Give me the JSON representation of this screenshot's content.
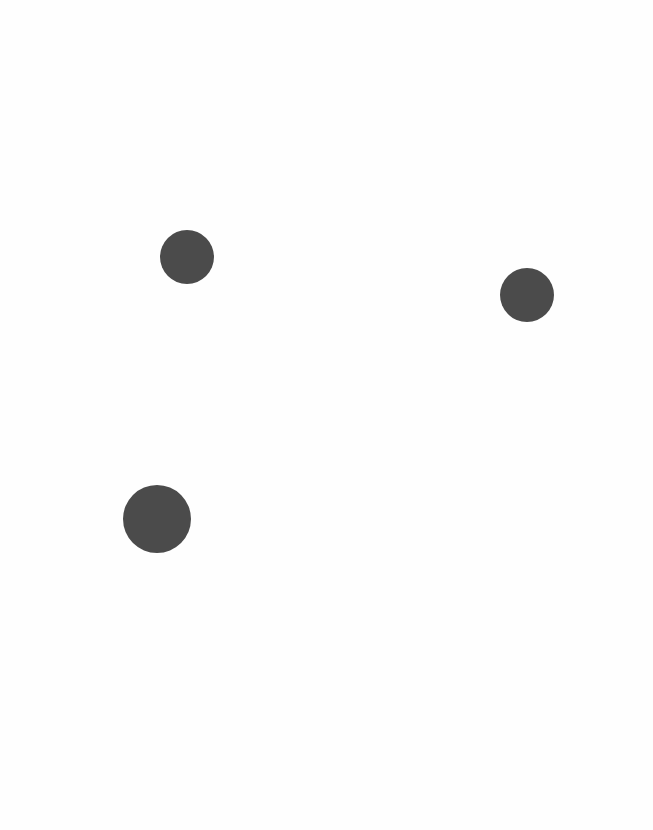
{
  "canvas": {
    "background": "#fefefe",
    "width": 653,
    "height": 830
  },
  "dots": [
    {
      "id": "dot-1",
      "center_x": 187,
      "center_y": 257,
      "radius": 27,
      "color": "#4b4b4b"
    },
    {
      "id": "dot-2",
      "center_x": 527,
      "center_y": 295,
      "radius": 27,
      "color": "#4b4b4b"
    },
    {
      "id": "dot-3",
      "center_x": 157,
      "center_y": 519,
      "radius": 34,
      "color": "#4b4b4b"
    }
  ]
}
